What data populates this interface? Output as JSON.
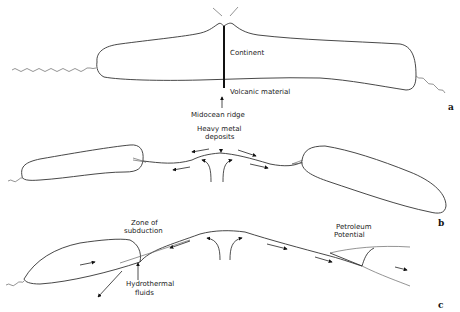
{
  "panels": {
    "a": {
      "label": "a",
      "continent_label": "Continent",
      "volcanic_label": "Volcanic material",
      "ridge_label": "Midocean ridge"
    },
    "b": {
      "label": "b",
      "deposits_label_line1": "Heavy metal",
      "deposits_label_line2": "deposits"
    },
    "c": {
      "label": "c",
      "subduction_line1": "Zone of",
      "subduction_line2": "subduction",
      "hydro_line1": "Hydrothermal",
      "hydro_line2": "fluids",
      "petroleum_line1": "Petroleum",
      "petroleum_line2": "Potential"
    }
  }
}
